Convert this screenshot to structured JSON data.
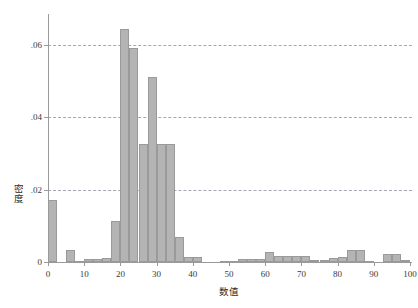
{
  "chart_data": {
    "type": "bar",
    "title": "",
    "subtitle": "",
    "xlabel": "数值",
    "ylabel": "密度",
    "xlim": [
      0,
      100
    ],
    "ylim": [
      0,
      0.068
    ],
    "grid": true,
    "grid_axis": "y",
    "grid_style": "dashed",
    "legend": false,
    "legend_position": "none",
    "bar_color": "#b4b4b4",
    "bar_edge_color": "#9a9a9a",
    "gridline_color": "#8a8a9c",
    "axis_color": "#9a9a9a",
    "bin_width": 2.5,
    "xticks": [
      0,
      10,
      20,
      30,
      40,
      50,
      60,
      70,
      80,
      90,
      100
    ],
    "xtick_labels": [
      "0",
      "10",
      "20",
      "30",
      "40",
      "50",
      "60",
      "70",
      "80",
      "90",
      "100"
    ],
    "yticks": [
      0,
      0.02,
      0.04,
      0.06
    ],
    "ytick_labels": [
      "0",
      ".02",
      ".04",
      ".06"
    ],
    "bins": [
      {
        "x0": 0.0,
        "x1": 2.5,
        "value": 0.017
      },
      {
        "x0": 2.5,
        "x1": 5.0,
        "value": 0.0
      },
      {
        "x0": 5.0,
        "x1": 7.5,
        "value": 0.0032
      },
      {
        "x0": 7.5,
        "x1": 10.0,
        "value": 0.0002
      },
      {
        "x0": 10.0,
        "x1": 12.5,
        "value": 0.0008
      },
      {
        "x0": 12.5,
        "x1": 15.0,
        "value": 0.0008
      },
      {
        "x0": 15.0,
        "x1": 17.5,
        "value": 0.001
      },
      {
        "x0": 17.5,
        "x1": 20.0,
        "value": 0.0112
      },
      {
        "x0": 20.0,
        "x1": 22.5,
        "value": 0.0643
      },
      {
        "x0": 22.5,
        "x1": 25.0,
        "value": 0.059
      },
      {
        "x0": 25.0,
        "x1": 27.5,
        "value": 0.0327
      },
      {
        "x0": 27.5,
        "x1": 30.0,
        "value": 0.051
      },
      {
        "x0": 30.0,
        "x1": 32.5,
        "value": 0.0327
      },
      {
        "x0": 32.5,
        "x1": 35.0,
        "value": 0.0327
      },
      {
        "x0": 35.0,
        "x1": 37.5,
        "value": 0.007
      },
      {
        "x0": 37.5,
        "x1": 40.0,
        "value": 0.0014
      },
      {
        "x0": 40.0,
        "x1": 42.5,
        "value": 0.0014
      },
      {
        "x0": 42.5,
        "x1": 45.0,
        "value": 0.0
      },
      {
        "x0": 45.0,
        "x1": 47.5,
        "value": 0.0
      },
      {
        "x0": 47.5,
        "x1": 50.0,
        "value": 0.0004
      },
      {
        "x0": 50.0,
        "x1": 52.5,
        "value": 0.0004
      },
      {
        "x0": 52.5,
        "x1": 55.0,
        "value": 0.0007
      },
      {
        "x0": 55.0,
        "x1": 57.5,
        "value": 0.0007
      },
      {
        "x0": 57.5,
        "x1": 60.0,
        "value": 0.0007
      },
      {
        "x0": 60.0,
        "x1": 62.5,
        "value": 0.0028
      },
      {
        "x0": 62.5,
        "x1": 65.0,
        "value": 0.0016
      },
      {
        "x0": 65.0,
        "x1": 67.5,
        "value": 0.0016
      },
      {
        "x0": 67.5,
        "x1": 70.0,
        "value": 0.0016
      },
      {
        "x0": 70.0,
        "x1": 72.5,
        "value": 0.0016
      },
      {
        "x0": 72.5,
        "x1": 75.0,
        "value": 0.0005
      },
      {
        "x0": 75.0,
        "x1": 77.5,
        "value": 0.0005
      },
      {
        "x0": 77.5,
        "x1": 80.0,
        "value": 0.001
      },
      {
        "x0": 80.0,
        "x1": 82.5,
        "value": 0.0013
      },
      {
        "x0": 82.5,
        "x1": 85.0,
        "value": 0.0032
      },
      {
        "x0": 85.0,
        "x1": 87.5,
        "value": 0.0032
      },
      {
        "x0": 87.5,
        "x1": 90.0,
        "value": 0.0004
      },
      {
        "x0": 90.0,
        "x1": 92.5,
        "value": 0.0
      },
      {
        "x0": 92.5,
        "x1": 95.0,
        "value": 0.0022
      },
      {
        "x0": 95.0,
        "x1": 97.5,
        "value": 0.0022
      },
      {
        "x0": 97.5,
        "x1": 100.0,
        "value": 0.0006
      }
    ]
  }
}
